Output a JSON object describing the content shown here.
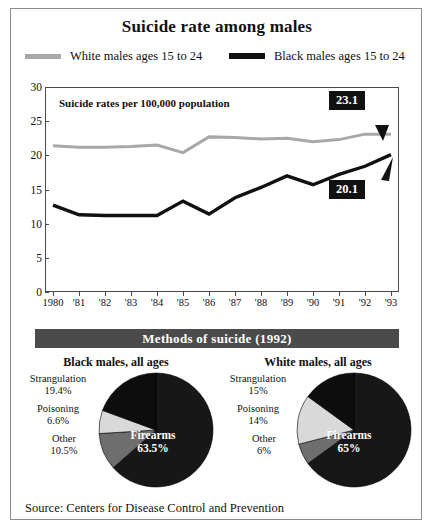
{
  "figure": {
    "title": "Suicide rate among males",
    "source": "Source: Centers for Disease Control and Prevention",
    "note": "Suicide rates per 100,000 population",
    "banner": "Methods of suicide (1992)"
  },
  "legend": {
    "white": "White males ages 15 to 24",
    "black": "Black males ages 15 to 24"
  },
  "callouts": {
    "white": "23.1",
    "black": "20.1"
  },
  "colors": {
    "white_series": "#a8a8a8",
    "black_series": "#111111",
    "banner_bg": "#4b4b4b",
    "frame": "#8a8a8a",
    "pie_firearms": "#171717",
    "pie_other": "#6e6e6e",
    "pie_poisoning": "#d9d9d9",
    "pie_strangulation": "#0d0d0d"
  },
  "chart_data": [
    {
      "type": "line",
      "title": "Suicide rate among males",
      "subtitle": "Suicide rates per 100,000 population",
      "xlabel": "",
      "ylabel": "",
      "ylim": [
        0,
        30
      ],
      "yticks": [
        0,
        5,
        10,
        15,
        20,
        25,
        30
      ],
      "grid": false,
      "legend_position": "top",
      "x": [
        "1980",
        "'81",
        "'82",
        "'83",
        "'84",
        "'85",
        "'86",
        "'87",
        "'88",
        "'89",
        "'90",
        "'91",
        "'92",
        "'93"
      ],
      "series": [
        {
          "name": "White males ages 15 to 24",
          "color": "#a8a8a8",
          "values": [
            21.4,
            21.2,
            21.2,
            21.3,
            21.5,
            20.4,
            22.7,
            22.6,
            22.4,
            22.5,
            22.0,
            22.3,
            23.1,
            23.1
          ],
          "end_label": "23.1"
        },
        {
          "name": "Black males ages 15 to 24",
          "color": "#111111",
          "values": [
            12.7,
            11.3,
            11.2,
            11.2,
            11.2,
            13.3,
            11.4,
            13.8,
            15.3,
            17.0,
            15.7,
            17.2,
            18.4,
            20.1
          ],
          "end_label": "20.1"
        }
      ]
    },
    {
      "type": "pie",
      "title": "Black males, all ages",
      "labels": [
        "Firearms",
        "Strangulation",
        "Poisoning",
        "Other"
      ],
      "values": [
        63.5,
        19.4,
        6.6,
        10.5
      ],
      "value_labels": [
        "63.5%",
        "19.4%",
        "6.6%",
        "10.5%"
      ],
      "colors": [
        "#171717",
        "#0d0d0d",
        "#d9d9d9",
        "#6e6e6e"
      ]
    },
    {
      "type": "pie",
      "title": "White males, all ages",
      "labels": [
        "Firearms",
        "Strangulation",
        "Poisoning",
        "Other"
      ],
      "values": [
        65,
        15,
        14,
        6
      ],
      "value_labels": [
        "65%",
        "15%",
        "14%",
        "6%"
      ],
      "colors": [
        "#171717",
        "#0d0d0d",
        "#d9d9d9",
        "#6e6e6e"
      ]
    }
  ]
}
